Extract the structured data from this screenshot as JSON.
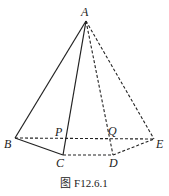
{
  "figure": {
    "caption": "图 F12.6.1",
    "points": {
      "A": {
        "label": "A",
        "x": 86,
        "y": 21
      },
      "B": {
        "label": "B",
        "x": 15,
        "y": 138
      },
      "C": {
        "label": "C",
        "x": 63,
        "y": 155
      },
      "D": {
        "label": "D",
        "x": 113,
        "y": 155
      },
      "E": {
        "label": "E",
        "x": 154,
        "y": 139
      },
      "P": {
        "label": "P",
        "x": 64,
        "y": 139
      },
      "Q": {
        "label": "Q",
        "x": 110,
        "y": 139
      }
    },
    "solid_segments": [
      "AB",
      "AC",
      "BC"
    ],
    "dashed_segments": [
      "AD",
      "AE",
      "BE",
      "CD",
      "DE"
    ]
  }
}
